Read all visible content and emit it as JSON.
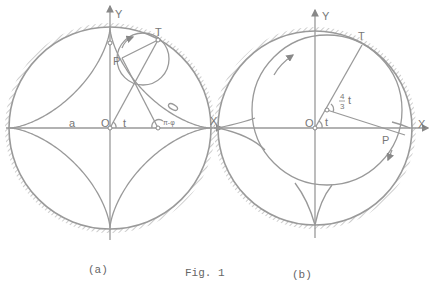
{
  "figure": {
    "caption": "Fig. 1",
    "panels": [
      {
        "id": "a",
        "label": "(a)",
        "axis_x": "X",
        "axis_y": "Y",
        "origin": "O",
        "points": {
          "tangent": "T",
          "tracer": "P"
        },
        "annotations": {
          "radius": "a",
          "angle": "t",
          "angle2": "π-φ",
          "phi": "φ"
        },
        "curve": "astroid"
      },
      {
        "id": "b",
        "label": "(b)",
        "axis_x": "X",
        "axis_y": "Y",
        "origin": "O",
        "points": {
          "tangent": "T",
          "tracer": "P"
        },
        "annotations": {
          "angle": "t",
          "angle2_num": "4",
          "angle2_den": "3",
          "angle2_var": "t"
        },
        "curve": "hypocycloid (large rolling circle)"
      }
    ]
  },
  "colors": {
    "line": "#999999",
    "text": "#777777",
    "background": "#ffffff"
  }
}
